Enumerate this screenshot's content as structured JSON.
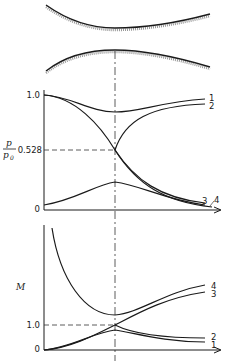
{
  "figure": {
    "nozzle": {
      "description": "Converging-diverging (de Laval) nozzle wall profile",
      "throat_marker": "center-line"
    },
    "pressure_plot": {
      "ylabel_num": "p",
      "ylabel_den": "p",
      "ylabel_den_sub": "0",
      "ticks": {
        "top": "1.0",
        "critical": "0.528",
        "zero": "0"
      },
      "curve_labels": [
        "1",
        "2",
        "3",
        "4"
      ]
    },
    "mach_plot": {
      "ylabel": "M",
      "ticks": {
        "one": "1.0",
        "zero": "0"
      },
      "curve_labels": [
        "4",
        "3",
        "2",
        "1"
      ]
    }
  }
}
